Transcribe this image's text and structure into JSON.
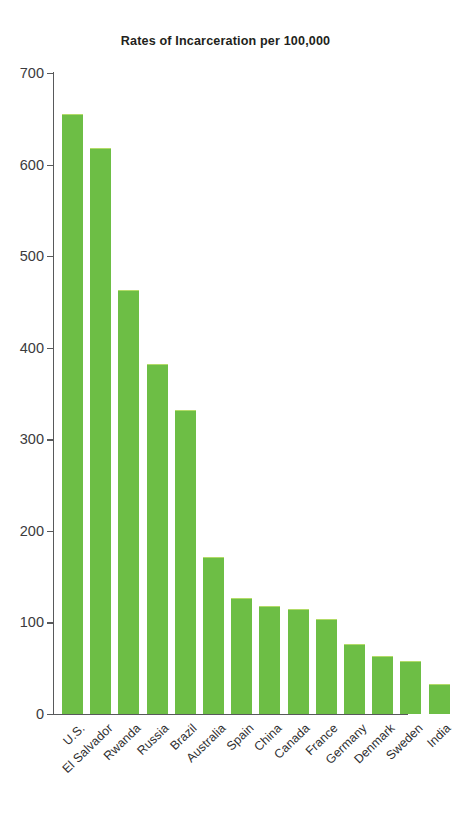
{
  "chart_data": {
    "type": "bar",
    "title": "Rates of Incarceration per 100,000",
    "xlabel": "",
    "ylabel": "",
    "ylim": [
      0,
      700
    ],
    "ytick_step": 100,
    "yticks": [
      0,
      100,
      200,
      300,
      400,
      500,
      600,
      700
    ],
    "grid": false,
    "legend": "none",
    "bar_color": "#6dbe45",
    "axis_color": "#58595b",
    "text_color": "#231f20",
    "background": "#ffffff",
    "categories": [
      "U.S.",
      "El Salvador",
      "Rwanda",
      "Russia",
      "Brazil",
      "Australia",
      "Spain",
      "China",
      "Canada",
      "France",
      "Germany",
      "Denmark",
      "Sweden",
      "India"
    ],
    "values": [
      655,
      618,
      463,
      382,
      332,
      171,
      127,
      118,
      115,
      104,
      77,
      63,
      58,
      33
    ]
  }
}
